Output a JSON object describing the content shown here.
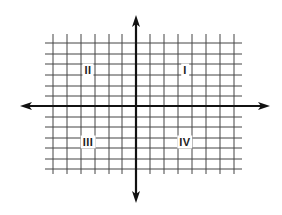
{
  "diagram": {
    "type": "coordinate-plane",
    "colors": {
      "grid": "#444444",
      "axis": "#111111",
      "background": "#ffffff",
      "label": "#222222"
    },
    "grid": {
      "x_start": 45,
      "x_end": 242,
      "x_lines": [
        53,
        67,
        81,
        95,
        109,
        122,
        150,
        164,
        178,
        192,
        206,
        220,
        234
      ],
      "y_start": 34,
      "y_end": 174,
      "y_lines": [
        43,
        54,
        64,
        75,
        86,
        96,
        117,
        127,
        138,
        148,
        159,
        169
      ]
    },
    "axes": {
      "x_axis": {
        "y": 106,
        "x_from": 20,
        "x_to": 270
      },
      "y_axis": {
        "x": 136,
        "y_from": 15,
        "y_to": 203
      }
    },
    "quadrants": [
      {
        "id": "I",
        "label": "I",
        "x": 185,
        "y": 70
      },
      {
        "id": "II",
        "label": "II",
        "x": 88,
        "y": 70
      },
      {
        "id": "III",
        "label": "III",
        "x": 88,
        "y": 142
      },
      {
        "id": "IV",
        "label": "IV",
        "x": 185,
        "y": 142
      }
    ]
  }
}
